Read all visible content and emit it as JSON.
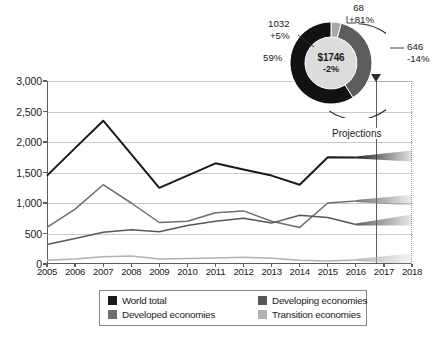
{
  "chart_data": {
    "type": "line",
    "title": "",
    "xlabel": "",
    "ylabel": "",
    "x": [
      2005,
      2006,
      2007,
      2008,
      2009,
      2010,
      2011,
      2012,
      2013,
      2014,
      2015,
      2016,
      2017,
      2018
    ],
    "xlim": [
      2005,
      2018
    ],
    "ylim": [
      0,
      3000
    ],
    "yticks": [
      0,
      500,
      1000,
      1500,
      2000,
      2500,
      3000
    ],
    "ytick_labels": [
      "0",
      "500",
      "1,000",
      "1,500",
      "2,000",
      "2,500",
      "3,000"
    ],
    "xtick_labels": [
      "2005",
      "2006",
      "2007",
      "2008",
      "2009",
      "2010",
      "2011",
      "2012",
      "2013",
      "2014",
      "2015",
      "2016",
      "2017",
      "2018"
    ],
    "grid": true,
    "legend_position": "bottom",
    "annotation": "Projections",
    "projection_start_year": 2016,
    "series": [
      {
        "name": "World total",
        "color": "#1a1a1a",
        "values": [
          1450,
          1900,
          2350,
          1800,
          1250,
          1450,
          1650,
          1550,
          1450,
          1300,
          1750,
          1746,
          1760,
          1770
        ]
      },
      {
        "name": "Developed economies",
        "color": "#6e6e6e",
        "values": [
          600,
          900,
          1300,
          1000,
          680,
          700,
          840,
          870,
          700,
          600,
          1000,
          1032,
          1040,
          1045
        ]
      },
      {
        "name": "Developing economies",
        "color": "#575757",
        "values": [
          320,
          420,
          520,
          560,
          530,
          630,
          700,
          750,
          670,
          800,
          760,
          646,
          700,
          720
        ]
      },
      {
        "name": "Transition economies",
        "color": "#b2b2b2",
        "values": [
          60,
          80,
          120,
          130,
          80,
          90,
          100,
          110,
          95,
          60,
          50,
          68,
          75,
          80
        ]
      }
    ]
  },
  "donut": {
    "center_value": "$1746",
    "center_change": "-2%",
    "segments": [
      {
        "label": "1032",
        "change": "+5%",
        "share": "59%",
        "color": "#121212",
        "value": 1032,
        "percent": 59
      },
      {
        "label": "646",
        "change": "-14%",
        "color": "#5d5d5d",
        "value": 646,
        "percent": 37
      },
      {
        "label": "68",
        "change": "+81%",
        "color": "#a9a9a9",
        "value": 68,
        "percent": 4
      }
    ]
  },
  "legend": {
    "items": [
      {
        "label": "World total",
        "color": "#1a1a1a"
      },
      {
        "label": "Developing economies",
        "color": "#575757"
      },
      {
        "label": "Developed economies",
        "color": "#6e6e6e"
      },
      {
        "label": "Transition economies",
        "color": "#b2b2b2"
      }
    ]
  },
  "axis": {
    "yticks": [
      "3,000",
      "2,500",
      "2,000",
      "1,500",
      "1,000",
      "500",
      "0"
    ],
    "xticks": [
      "2005",
      "2006",
      "2007",
      "2008",
      "2009",
      "2010",
      "2011",
      "2012",
      "2013",
      "2014",
      "2015",
      "2016",
      "2017",
      "2018"
    ]
  },
  "projections": {
    "label": "Projections"
  }
}
